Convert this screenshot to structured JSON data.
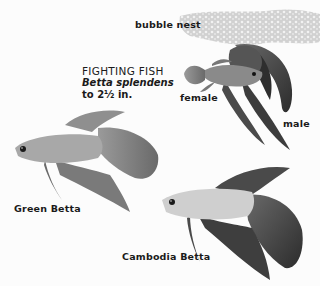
{
  "title": {
    "common_name": "FIGHTING FISH",
    "scientific_name": "Betta splendens",
    "size": "to 2½ in."
  },
  "labels": {
    "bubble_nest": "bubble nest",
    "female": "female",
    "male": "male",
    "green_betta": "Green Betta",
    "cambodia_betta": "Cambodia Betta"
  },
  "colors": {
    "background": "#fcfcfc",
    "ink": "#1a1a1a",
    "fish_body_light": "#c8c8c8",
    "fish_fin_dark": "#3a3a3a"
  }
}
